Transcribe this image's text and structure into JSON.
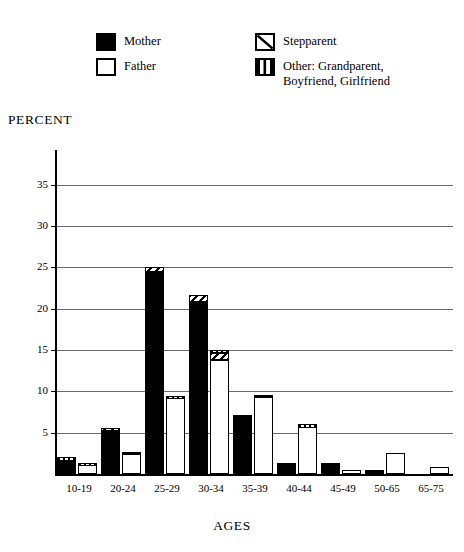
{
  "legend": {
    "entries": [
      {
        "key": "mother",
        "label": "Mother",
        "swatch": "solid-black-square-icon"
      },
      {
        "key": "father",
        "label": "Father",
        "swatch": "open-white-square-icon"
      },
      {
        "key": "stepparent",
        "label": "Stepparent",
        "swatch": "diagonal-hatch-square-icon"
      },
      {
        "key": "other",
        "label": "Other: Grandparent,\nBoyfriend, Girlfriend",
        "swatch": "vertical-hatch-square-icon"
      }
    ]
  },
  "axes": {
    "y_title": "PERCENT",
    "x_title": "AGES",
    "y_ticks": [
      "5",
      "10",
      "15",
      "20",
      "25",
      "30",
      "35"
    ]
  },
  "chart_data": {
    "type": "bar",
    "title": "",
    "subtitle": "",
    "xlabel": "AGES",
    "ylabel": "PERCENT",
    "ylim": [
      0,
      38
    ],
    "ytick_values": [
      5,
      10,
      15,
      20,
      25,
      30,
      35
    ],
    "grid": true,
    "grid_axis": "y",
    "legend_position": "top",
    "stacked": true,
    "group_layout": "two bars per age group: Mother (left) and Father (right); each bar is topped by small Stepparent and/or Other segments",
    "categories": [
      "10-19",
      "20-24",
      "25-29",
      "30-34",
      "35-39",
      "40-44",
      "45-49",
      "50-65",
      "65-75"
    ],
    "series": [
      {
        "name": "Mother",
        "pattern": "solid-black",
        "values": [
          1.4,
          5.0,
          24.2,
          20.6,
          7.2,
          1.3,
          1.3,
          0.5,
          0.0
        ]
      },
      {
        "name": "Mother-Stepparent-cap",
        "pattern": "diagonal-hatch",
        "values": [
          0.0,
          0.6,
          0.8,
          1.1,
          0.0,
          0.0,
          0.0,
          0.0,
          0.0
        ]
      },
      {
        "name": "Mother-Other-cap",
        "pattern": "vertical-hatch",
        "values": [
          0.7,
          0.0,
          0.0,
          0.0,
          0.0,
          0.0,
          0.0,
          0.0,
          0.0
        ]
      },
      {
        "name": "Father",
        "pattern": "open-white",
        "values": [
          0.8,
          2.2,
          8.9,
          13.6,
          9.1,
          5.4,
          0.5,
          2.5,
          0.9
        ]
      },
      {
        "name": "Father-Stepparent-cap",
        "pattern": "diagonal-hatch",
        "values": [
          0.0,
          0.0,
          0.0,
          0.8,
          0.0,
          0.0,
          0.0,
          0.0,
          0.0
        ]
      },
      {
        "name": "Father-Other-cap",
        "pattern": "vertical-hatch",
        "values": [
          0.5,
          0.5,
          0.5,
          0.6,
          0.5,
          0.6,
          0.0,
          0.0,
          0.0
        ]
      }
    ],
    "group_totals": {
      "Mother": [
        2.1,
        5.6,
        25.0,
        21.7,
        7.2,
        1.3,
        1.3,
        0.5,
        0.0
      ],
      "Father": [
        1.3,
        2.7,
        9.4,
        15.0,
        9.6,
        6.0,
        0.5,
        2.5,
        0.9
      ]
    }
  }
}
